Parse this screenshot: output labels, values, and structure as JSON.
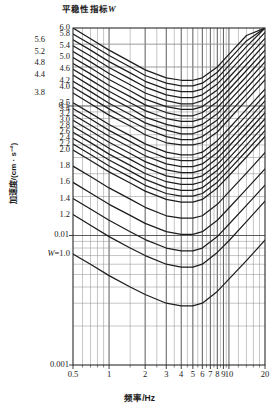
{
  "figure": {
    "title_text": "平稳性指标",
    "title_symbol": "W",
    "x_axis_label": "频率/Hz",
    "y_axis_label": "加速度/(cm · s⁻²)"
  },
  "axes": {
    "x_ticks": [
      "0.5",
      "1",
      "2",
      "3",
      "4",
      "5",
      "6",
      "7",
      "8",
      "9",
      "10",
      "20"
    ],
    "y_ticks": [
      "0.1",
      "0.01",
      "0.001"
    ]
  },
  "curve_labels_outer": [
    "5.6",
    "5.2",
    "4.8",
    "4.4",
    "3.8"
  ],
  "curve_labels_inner": [
    "6.0",
    "5.8",
    "5.4",
    "5.0",
    "4.6",
    "4.2",
    "4.0",
    "3.5",
    "3.4",
    "3.2",
    "3.0",
    "2.8",
    "2.6",
    "2.4",
    "2.2",
    "2.0",
    "1.8",
    "1.6",
    "1.4",
    "1.2"
  ],
  "bottom_curve_label": {
    "prefix": "W",
    "value": "=1.0"
  },
  "chart_data": {
    "type": "line",
    "title": "平稳性指标W",
    "xlabel": "频率/Hz",
    "ylabel": "加速度/(cm · s⁻²)",
    "xscale": "log",
    "yscale": "log",
    "xlim": [
      0.5,
      20
    ],
    "ylim": [
      0.001,
      0.4
    ],
    "grid": true,
    "legend": "inline-curve-labels",
    "annotations": [
      "W=1.0 marks the lowest curve",
      "Each curve is a constant ride-index W contour"
    ],
    "x": [
      0.5,
      0.7,
      1.0,
      1.5,
      2.0,
      3.0,
      4.0,
      5.0,
      6.0,
      8.0,
      10.0,
      14.0,
      20.0
    ],
    "series": [
      {
        "name": "W=6.0",
        "values": [
          0.4,
          0.33,
          0.27,
          0.22,
          0.19,
          0.165,
          0.158,
          0.158,
          0.165,
          0.2,
          0.25,
          0.35,
          0.4
        ]
      },
      {
        "name": "W=5.8",
        "values": [
          0.36,
          0.3,
          0.245,
          0.2,
          0.172,
          0.15,
          0.143,
          0.143,
          0.15,
          0.182,
          0.227,
          0.318,
          0.4
        ]
      },
      {
        "name": "W=5.6",
        "values": [
          0.325,
          0.27,
          0.22,
          0.18,
          0.155,
          0.135,
          0.129,
          0.129,
          0.135,
          0.164,
          0.205,
          0.287,
          0.4
        ]
      },
      {
        "name": "W=5.4",
        "values": [
          0.292,
          0.243,
          0.198,
          0.162,
          0.14,
          0.122,
          0.116,
          0.116,
          0.122,
          0.148,
          0.184,
          0.258,
          0.37
        ]
      },
      {
        "name": "W=5.2",
        "values": [
          0.263,
          0.219,
          0.178,
          0.146,
          0.126,
          0.11,
          0.104,
          0.104,
          0.11,
          0.133,
          0.166,
          0.232,
          0.333
        ]
      },
      {
        "name": "W=5.0",
        "values": [
          0.237,
          0.197,
          0.16,
          0.131,
          0.113,
          0.099,
          0.094,
          0.094,
          0.099,
          0.12,
          0.149,
          0.209,
          0.3
        ]
      },
      {
        "name": "W=4.8",
        "values": [
          0.213,
          0.177,
          0.144,
          0.118,
          0.102,
          0.089,
          0.084,
          0.084,
          0.089,
          0.108,
          0.134,
          0.188,
          0.27
        ]
      },
      {
        "name": "W=4.6",
        "values": [
          0.192,
          0.159,
          0.13,
          0.106,
          0.092,
          0.08,
          0.076,
          0.076,
          0.08,
          0.097,
          0.121,
          0.169,
          0.243
        ]
      },
      {
        "name": "W=4.4",
        "values": [
          0.173,
          0.143,
          0.117,
          0.096,
          0.082,
          0.072,
          0.068,
          0.068,
          0.072,
          0.087,
          0.109,
          0.152,
          0.219
        ]
      },
      {
        "name": "W=4.2",
        "values": [
          0.155,
          0.129,
          0.105,
          0.086,
          0.074,
          0.065,
          0.061,
          0.061,
          0.065,
          0.078,
          0.098,
          0.137,
          0.197
        ]
      },
      {
        "name": "W=4.0",
        "values": [
          0.14,
          0.116,
          0.095,
          0.077,
          0.067,
          0.058,
          0.055,
          0.055,
          0.058,
          0.07,
          0.088,
          0.123,
          0.177
        ]
      },
      {
        "name": "W=3.8",
        "values": [
          0.126,
          0.104,
          0.085,
          0.07,
          0.06,
          0.052,
          0.05,
          0.05,
          0.052,
          0.063,
          0.079,
          0.111,
          0.159
        ]
      },
      {
        "name": "W=3.5",
        "values": [
          0.106,
          0.088,
          0.072,
          0.059,
          0.051,
          0.044,
          0.042,
          0.042,
          0.044,
          0.054,
          0.067,
          0.094,
          0.135
        ]
      },
      {
        "name": "W=3.4",
        "values": [
          0.0955,
          0.0793,
          0.0648,
          0.0531,
          0.0459,
          0.0396,
          0.0378,
          0.0378,
          0.0396,
          0.0486,
          0.0603,
          0.0846,
          0.1215
        ]
      },
      {
        "name": "W=3.2",
        "values": [
          0.086,
          0.0714,
          0.0583,
          0.0478,
          0.0413,
          0.0357,
          0.034,
          0.034,
          0.0357,
          0.0437,
          0.0543,
          0.0761,
          0.1094
        ]
      },
      {
        "name": "W=3.0",
        "values": [
          0.0774,
          0.0643,
          0.0525,
          0.043,
          0.0372,
          0.0321,
          0.0306,
          0.0306,
          0.0321,
          0.0394,
          0.0489,
          0.0685,
          0.0984
        ]
      },
      {
        "name": "W=2.8",
        "values": [
          0.0696,
          0.0578,
          0.0472,
          0.0387,
          0.0335,
          0.0289,
          0.0276,
          0.0276,
          0.0289,
          0.0354,
          0.044,
          0.0616,
          0.0886
        ]
      },
      {
        "name": "W=2.6",
        "values": [
          0.0627,
          0.0521,
          0.0425,
          0.0348,
          0.0301,
          0.026,
          0.0248,
          0.0248,
          0.026,
          0.0319,
          0.0396,
          0.0555,
          0.0797
        ]
      },
      {
        "name": "W=2.4",
        "values": [
          0.0564,
          0.0468,
          0.0383,
          0.0314,
          0.0271,
          0.0234,
          0.0223,
          0.0223,
          0.0234,
          0.0287,
          0.0356,
          0.0499,
          0.0718
        ]
      },
      {
        "name": "W=2.2",
        "values": [
          0.0508,
          0.0422,
          0.0344,
          0.0282,
          0.0244,
          0.0211,
          0.0201,
          0.0201,
          0.0211,
          0.0258,
          0.0321,
          0.0449,
          0.0646
        ]
      },
      {
        "name": "W=2.0",
        "values": [
          0.0457,
          0.0379,
          0.031,
          0.0254,
          0.022,
          0.019,
          0.0181,
          0.0181,
          0.019,
          0.0233,
          0.0289,
          0.0404,
          0.0581
        ]
      },
      {
        "name": "W=1.8",
        "values": [
          0.0343,
          0.0285,
          0.0233,
          0.0191,
          0.0165,
          0.0142,
          0.0136,
          0.0136,
          0.0142,
          0.0174,
          0.0217,
          0.0303,
          0.0436
        ]
      },
      {
        "name": "W=1.6",
        "values": [
          0.0257,
          0.0213,
          0.0174,
          0.0143,
          0.0124,
          0.0107,
          0.0102,
          0.0102,
          0.0107,
          0.0131,
          0.0163,
          0.0228,
          0.0327
        ]
      },
      {
        "name": "W=1.4",
        "values": [
          0.0193,
          0.016,
          0.0131,
          0.0107,
          0.0093,
          0.008,
          0.0076,
          0.0076,
          0.008,
          0.0098,
          0.0122,
          0.0171,
          0.0245
        ]
      },
      {
        "name": "W=1.2",
        "values": [
          0.0145,
          0.012,
          0.0098,
          0.008,
          0.007,
          0.006,
          0.0057,
          0.0057,
          0.006,
          0.0074,
          0.0091,
          0.0128,
          0.0184
        ]
      },
      {
        "name": "W=1.0",
        "values": [
          0.0072,
          0.006,
          0.0049,
          0.004,
          0.0035,
          0.003,
          0.00286,
          0.00286,
          0.003,
          0.0037,
          0.0046,
          0.0064,
          0.0092
        ]
      }
    ]
  }
}
